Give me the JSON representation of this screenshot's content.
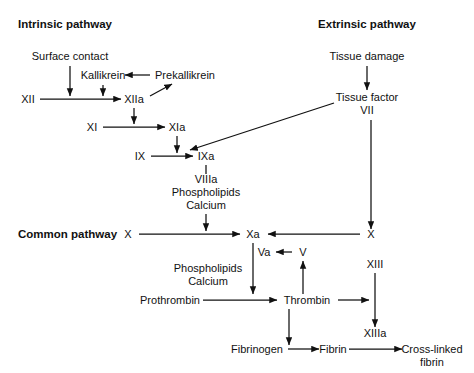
{
  "figure": {
    "background_color": "#ffffff",
    "ink_color": "#111111"
  },
  "headings": {
    "intrinsic": "Intrinsic pathway",
    "extrinsic": "Extrinsic pathway",
    "common": "Common pathway"
  },
  "nodes": {
    "surface_contact": "Surface contact",
    "kallikrein": "Kallikrein",
    "prekallikrein": "Prekallikrein",
    "factor_xii": "XII",
    "factor_xiia": "XIIa",
    "factor_xi": "XI",
    "factor_xia": "XIa",
    "factor_ix": "IX",
    "factor_ixa": "IXa",
    "cofactor_viiia": "VIIIa",
    "cofactor_phospholipids_1": "Phospholipids",
    "cofactor_calcium_1": "Calcium",
    "tissue_damage": "Tissue damage",
    "tissue_factor": "Tissue factor",
    "factor_vii": "VII",
    "factor_x_left": "X",
    "factor_xa": "Xa",
    "factor_x_right": "X",
    "factor_va": "Va",
    "factor_v": "V",
    "cofactor_phospholipids_2": "Phospholipids",
    "cofactor_calcium_2": "Calcium",
    "prothrombin": "Prothrombin",
    "thrombin": "Thrombin",
    "factor_xiii": "XIII",
    "factor_xiiia": "XIIIa",
    "fibrinogen": "Fibrinogen",
    "fibrin": "Fibrin",
    "cross_linked_line1": "Cross-linked",
    "cross_linked_line2": "fibrin"
  }
}
